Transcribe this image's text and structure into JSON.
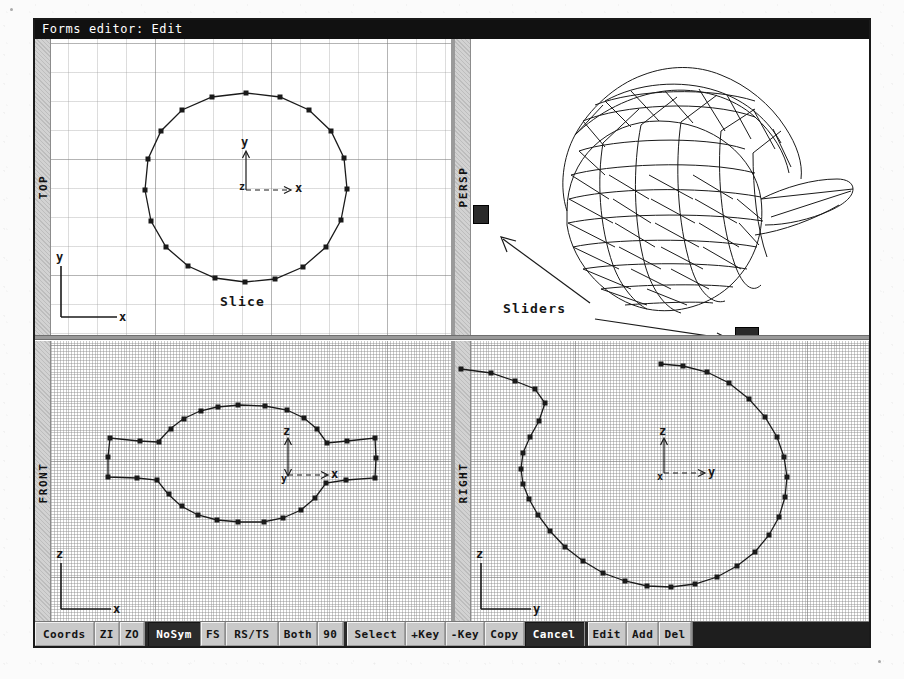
{
  "window": {
    "title": "Forms editor: Edit"
  },
  "viewports": {
    "top": {
      "label": "TOP",
      "axis_up": "y",
      "axis_right": "x",
      "axis_origin": "z",
      "gnomon_up": "y",
      "gnomon_right": "x",
      "annotation": "Slice"
    },
    "persp": {
      "label": "PERSP",
      "annotation": "Sliders"
    },
    "front": {
      "label": "FRONT",
      "axis_up": "z",
      "axis_right": "x",
      "axis_origin": "y",
      "gnomon_up": "z",
      "gnomon_right": "x"
    },
    "right": {
      "label": "RIGHT",
      "axis_up": "z",
      "axis_right": "y",
      "axis_origin": "x",
      "gnomon_up": "z",
      "gnomon_right": "y"
    }
  },
  "toolbar": {
    "buttons": [
      {
        "label": "Coords",
        "active": false
      },
      {
        "label": "ZI",
        "active": false
      },
      {
        "label": "ZO",
        "active": false
      },
      {
        "sep": true
      },
      {
        "label": "NoSym",
        "active": true
      },
      {
        "label": "FS",
        "active": false
      },
      {
        "label": "RS/TS",
        "active": false
      },
      {
        "label": "Both",
        "active": false
      },
      {
        "label": "90",
        "active": false
      },
      {
        "sep": true
      },
      {
        "label": "Select",
        "active": false
      },
      {
        "label": "+Key",
        "active": false
      },
      {
        "label": "-Key",
        "active": false
      },
      {
        "label": "Copy",
        "active": false
      },
      {
        "label": "Cancel",
        "active": true
      },
      {
        "sep": true
      },
      {
        "label": "Edit",
        "active": false
      },
      {
        "label": "Add",
        "active": false
      },
      {
        "label": "Del",
        "active": false
      }
    ]
  },
  "colors": {
    "titlebar_bg": "#111111",
    "titlebar_fg": "#ffffff",
    "toolbar_bg": "#bfbfbf",
    "button_bg": "#c9c9c9",
    "button_active_bg": "#2b2b2b",
    "grid_line": "#8c8c8c",
    "geometry_stroke": "#1a1a1a",
    "strip_bg": "#d2d2d2"
  }
}
